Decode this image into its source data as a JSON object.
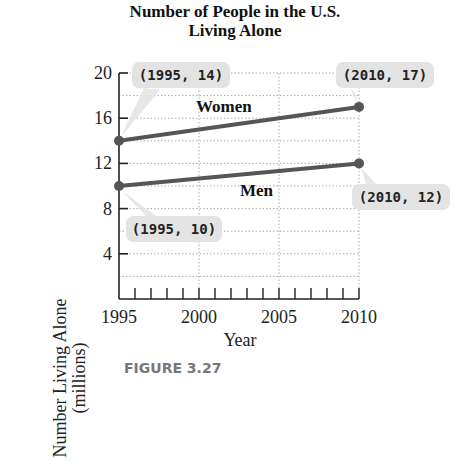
{
  "chart_data": {
    "type": "line",
    "title": "Number of People in the U.S. Living Alone",
    "title_lines": [
      "Number of People in the U.S.",
      "Living Alone"
    ],
    "xlabel": "Year",
    "ylabel": "Number Living Alone (millions)",
    "ylabel_lines": [
      "Number Living Alone",
      "(millions)"
    ],
    "xlim": [
      1995,
      2010
    ],
    "ylim": [
      0,
      20
    ],
    "x_ticks": [
      1995,
      2000,
      2005,
      2010
    ],
    "x_tick_labels": [
      "1995",
      "2000",
      "2005",
      "2010"
    ],
    "y_ticks": [
      4,
      8,
      12,
      16,
      20
    ],
    "y_tick_labels": [
      "4",
      "8",
      "12",
      "16",
      "20"
    ],
    "grid": true,
    "legend": "inline labels",
    "series": [
      {
        "name": "Women",
        "x": [
          1995,
          2010
        ],
        "values": [
          14,
          17
        ],
        "color": "#555555",
        "annotations": [
          "(1995, 14)",
          "(2010, 17)"
        ]
      },
      {
        "name": "Men",
        "x": [
          1995,
          2010
        ],
        "values": [
          10,
          12
        ],
        "color": "#555555",
        "annotations": [
          "(1995, 10)",
          "(2010, 12)"
        ]
      }
    ]
  },
  "figure_caption": "FIGURE 3.27",
  "colors": {
    "line": "#555555",
    "callout_fill": "#e3e3e3",
    "grid": "#aaaaaa",
    "axis": "#222222"
  }
}
